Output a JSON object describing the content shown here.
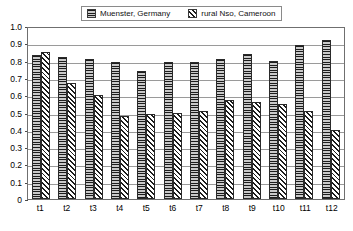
{
  "chart_data": {
    "type": "bar",
    "title": "",
    "xlabel": "",
    "ylabel": "",
    "categories": [
      "t1",
      "t2",
      "t3",
      "t4",
      "t5",
      "t6",
      "t7",
      "t8",
      "t9",
      "t10",
      "t11",
      "t12"
    ],
    "series": [
      {
        "name": "Muenster, Germany",
        "pattern": "horizontal-lines",
        "values": [
          0.83,
          0.82,
          0.81,
          0.79,
          0.74,
          0.79,
          0.79,
          0.81,
          0.84,
          0.8,
          0.89,
          0.92
        ]
      },
      {
        "name": "rural Nso, Cameroon",
        "pattern": "diagonal-hatch",
        "values": [
          0.85,
          0.67,
          0.6,
          0.48,
          0.49,
          0.5,
          0.51,
          0.57,
          0.56,
          0.55,
          0.51,
          0.4
        ]
      }
    ],
    "ylim": [
      0,
      1.0
    ],
    "ytick_labels": [
      "1.0",
      "0.9",
      "0.8",
      "0.7",
      "0.6",
      "0.5",
      "0.4",
      "0.3",
      "0.2",
      "0.1",
      "0"
    ],
    "ytick_values": [
      1.0,
      0.9,
      0.8,
      0.7,
      0.6,
      0.5,
      0.4,
      0.3,
      0.2,
      0.1,
      0
    ],
    "grid": true,
    "legend_position": "top-center"
  },
  "legend": {
    "entries": [
      {
        "label": "Muenster, Germany"
      },
      {
        "label": "rural Nso, Cameroon"
      }
    ]
  }
}
